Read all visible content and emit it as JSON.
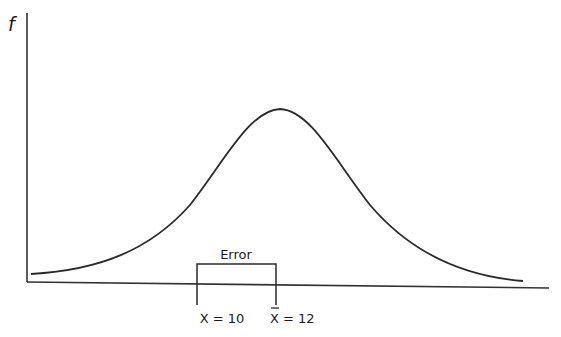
{
  "diagram": {
    "y_axis_label": "f",
    "bracket_label": "Error",
    "x_label_left": "X = 10",
    "x_label_right_symbol": "X",
    "x_label_right_rest": " = 12",
    "colors": {
      "line": "#2a2a2a",
      "background": "#ffffff"
    }
  }
}
